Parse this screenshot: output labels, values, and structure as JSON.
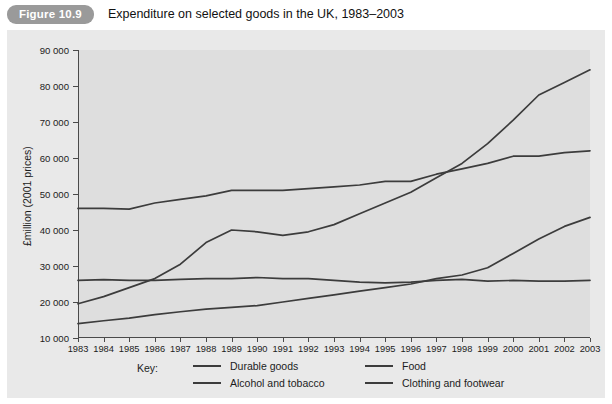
{
  "figure": {
    "badge_label": "Figure 10.9",
    "title": "Expenditure on selected goods in the UK, 1983–2003"
  },
  "legend": {
    "key_label": "Key:",
    "entries": [
      {
        "label": "Durable goods",
        "color": "#3c3c3c"
      },
      {
        "label": "Food",
        "color": "#3c3c3c"
      },
      {
        "label": "Alcohol and tobacco",
        "color": "#3c3c3c"
      },
      {
        "label": "Clothing and footwear",
        "color": "#3c3c3c"
      }
    ]
  },
  "colors": {
    "panel_background": "#e9e9e9",
    "plot_background": "#dedede",
    "axis": "#4a4a4a",
    "line": "#3c3c3c",
    "badge_background": "#9a9a9a",
    "badge_text": "#ffffff"
  },
  "chart_data": {
    "type": "line",
    "title": "Expenditure on selected goods in the UK, 1983–2003",
    "subtitle": "",
    "xlabel": "",
    "ylabel": "£million (2001 prices)",
    "ylim": [
      10000,
      90000
    ],
    "ytick_labels": [
      "90 000",
      "80 000",
      "70 000",
      "60 000",
      "50 000",
      "40 000",
      "30 000",
      "20 000",
      "10 000"
    ],
    "ytick_values": [
      90000,
      80000,
      70000,
      60000,
      50000,
      40000,
      30000,
      20000,
      10000
    ],
    "grid": false,
    "legend_position": "bottom",
    "x": [
      1983,
      1984,
      1985,
      1986,
      1987,
      1988,
      1989,
      1990,
      1991,
      1992,
      1993,
      1994,
      1995,
      1996,
      1997,
      1998,
      1999,
      2000,
      2001,
      2002,
      2003
    ],
    "xtick_labels": [
      "1983",
      "1984",
      "1985",
      "1986",
      "1987",
      "1988",
      "1989",
      "1990",
      "1991",
      "1992",
      "1993",
      "1994",
      "1995",
      "1996",
      "1997",
      "1998",
      "1999",
      "2000",
      "2001",
      "2002",
      "2003"
    ],
    "series": [
      {
        "name": "Durable goods",
        "values": [
          19500,
          21500,
          24000,
          26500,
          30500,
          36500,
          40000,
          39500,
          38500,
          39500,
          41500,
          44500,
          47500,
          50500,
          54500,
          58500,
          64000,
          70500,
          77500,
          81000,
          84500
        ]
      },
      {
        "name": "Food",
        "values": [
          46000,
          46000,
          45800,
          47500,
          48500,
          49500,
          51000,
          51000,
          51000,
          51500,
          52000,
          52500,
          53500,
          53500,
          55500,
          57000,
          58500,
          60500,
          60500,
          61500,
          62000
        ]
      },
      {
        "name": "Alcohol and tobacco",
        "values": [
          26000,
          26200,
          26000,
          26000,
          26300,
          26500,
          26500,
          26800,
          26500,
          26500,
          26000,
          25500,
          25300,
          25500,
          26000,
          26300,
          25800,
          26000,
          25800,
          25800,
          26000
        ]
      },
      {
        "name": "Clothing and footwear",
        "values": [
          14000,
          14800,
          15500,
          16500,
          17300,
          18000,
          18500,
          19000,
          20000,
          21000,
          22000,
          23000,
          24000,
          25000,
          26500,
          27500,
          29500,
          33500,
          37500,
          41000,
          43500
        ]
      }
    ]
  }
}
